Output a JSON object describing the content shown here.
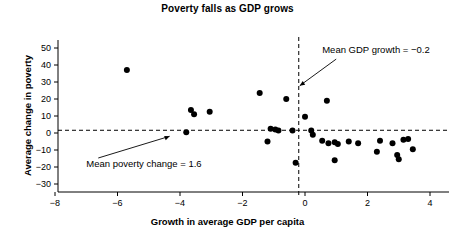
{
  "chart_data": {
    "type": "scatter",
    "title": "Poverty falls as GDP grows",
    "xlabel": "Growth in average GDP per capita",
    "ylabel": "Average change in poverty",
    "xlim": [
      -8.8,
      4.6
    ],
    "ylim": [
      -33,
      54
    ],
    "xticks": [
      -8,
      -6,
      -4,
      -2,
      0,
      2,
      4
    ],
    "xticklabels": [
      "−8",
      "−6",
      "−4",
      "−2",
      "0",
      "2",
      "4"
    ],
    "yticks": [
      50,
      40,
      30,
      20,
      10,
      0,
      -10,
      -20,
      -30
    ],
    "yticklabels": [
      "50",
      "40",
      "30",
      "20",
      "10",
      "0",
      "−10",
      "−20",
      "−30"
    ],
    "grid": false,
    "legend": null,
    "reference_lines": [
      {
        "name": "mean-poverty-change",
        "orientation": "horizontal",
        "value": 1.6,
        "style": "dashed",
        "label": "Mean poverty change = 1.6"
      },
      {
        "name": "mean-gdp-growth",
        "orientation": "vertical",
        "value": -0.2,
        "style": "dashed",
        "label": "Mean GDP growth = −0.2"
      }
    ],
    "annotations": [
      {
        "name": "mean-gdp-growth-annotation",
        "text": "Mean GDP growth = −0.2",
        "x": 0.55,
        "y": 47,
        "arrow_to": [
          -0.2,
          29
        ]
      },
      {
        "name": "mean-poverty-change-annotation",
        "text": "Mean poverty change = 1.6",
        "x": -7.0,
        "y": -20,
        "arrow_to": [
          -4.3,
          1.6
        ]
      }
    ],
    "points": [
      {
        "x": -5.7,
        "y": 37.0
      },
      {
        "x": -3.65,
        "y": 13.5
      },
      {
        "x": -3.55,
        "y": 11.0
      },
      {
        "x": -3.05,
        "y": 12.5
      },
      {
        "x": -3.8,
        "y": 0.5
      },
      {
        "x": -1.45,
        "y": 23.5
      },
      {
        "x": -0.6,
        "y": 20.0
      },
      {
        "x": 0.7,
        "y": 19.0
      },
      {
        "x": -1.1,
        "y": 2.5
      },
      {
        "x": -0.95,
        "y": 2.0
      },
      {
        "x": -0.85,
        "y": 1.5
      },
      {
        "x": -0.4,
        "y": 1.5
      },
      {
        "x": -1.2,
        "y": -5.0
      },
      {
        "x": 0.0,
        "y": 9.5
      },
      {
        "x": 0.2,
        "y": 1.5
      },
      {
        "x": 0.25,
        "y": -1.0
      },
      {
        "x": 0.55,
        "y": -4.5
      },
      {
        "x": 0.75,
        "y": -6.0
      },
      {
        "x": 0.95,
        "y": -5.5
      },
      {
        "x": 1.05,
        "y": -6.5
      },
      {
        "x": 1.4,
        "y": -5.0
      },
      {
        "x": 1.7,
        "y": -6.0
      },
      {
        "x": -0.3,
        "y": -17.5
      },
      {
        "x": 0.95,
        "y": -16.0
      },
      {
        "x": 2.4,
        "y": -4.5
      },
      {
        "x": 2.8,
        "y": -6.0
      },
      {
        "x": 3.15,
        "y": -4.0
      },
      {
        "x": 3.3,
        "y": -3.5
      },
      {
        "x": 2.3,
        "y": -11.0
      },
      {
        "x": 2.95,
        "y": -13.0
      },
      {
        "x": 3.0,
        "y": -15.5
      },
      {
        "x": 3.45,
        "y": -9.5
      }
    ]
  }
}
